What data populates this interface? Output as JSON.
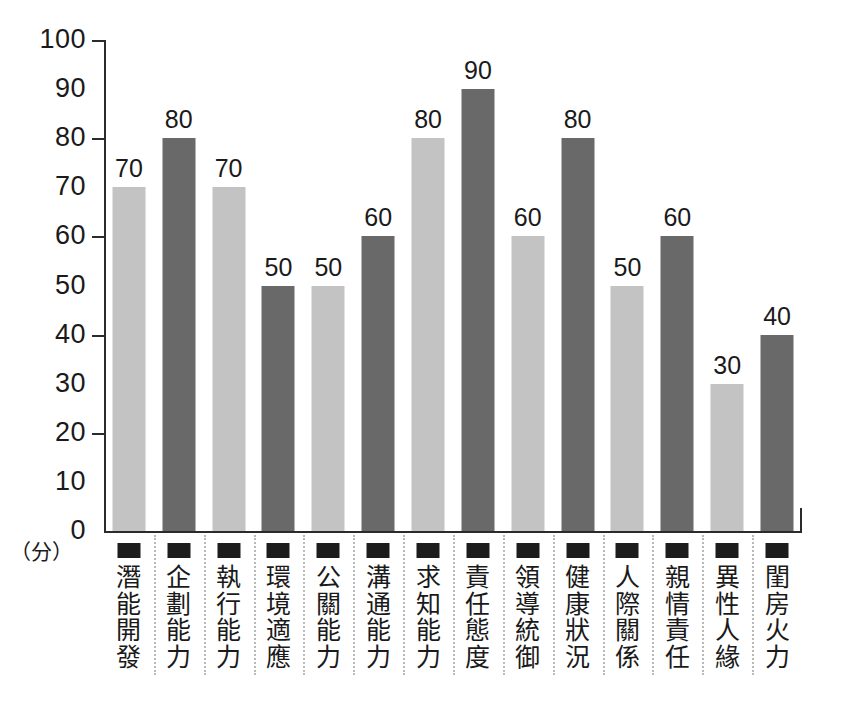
{
  "chart_data": {
    "type": "bar",
    "title": "",
    "xlabel": "",
    "ylabel": "",
    "unit_label": "（分）",
    "ylim": [
      0,
      100
    ],
    "grid": false,
    "legend": "none",
    "y_ticks": [
      "100",
      "90",
      "80",
      "70",
      "60",
      "50",
      "40",
      "30",
      "20",
      "10",
      "0"
    ],
    "y_tick_values": [
      100,
      90,
      80,
      70,
      60,
      50,
      40,
      30,
      20,
      10,
      0
    ],
    "y_major_ticks": [
      100,
      80,
      60,
      40,
      20,
      0
    ],
    "categories": [
      "潛能開發",
      "企劃能力",
      "執行能力",
      "環境適應",
      "公關能力",
      "溝通能力",
      "求知能力",
      "責任態度",
      "領導統御",
      "健康狀況",
      "人際關係",
      "親情責任",
      "異性人緣",
      "閨房火力"
    ],
    "values": [
      70,
      80,
      70,
      50,
      50,
      60,
      80,
      90,
      60,
      80,
      50,
      60,
      30,
      40
    ],
    "value_labels": [
      "70",
      "80",
      "70",
      "50",
      "50",
      "60",
      "80",
      "90",
      "60",
      "80",
      "50",
      "60",
      "30",
      "40"
    ],
    "bar_styles": [
      "light",
      "dark",
      "light",
      "dark",
      "light",
      "dark",
      "light",
      "dark",
      "light",
      "dark",
      "light",
      "dark",
      "light",
      "dark"
    ],
    "colors": {
      "light_bar": "#c3c3c3",
      "dark_bar": "#696969",
      "axis": "#2b2b2b",
      "text": "#1a1a1a",
      "separator": "#b9b9b9",
      "marker": "#1c1c1c",
      "background": "#ffffff"
    }
  }
}
